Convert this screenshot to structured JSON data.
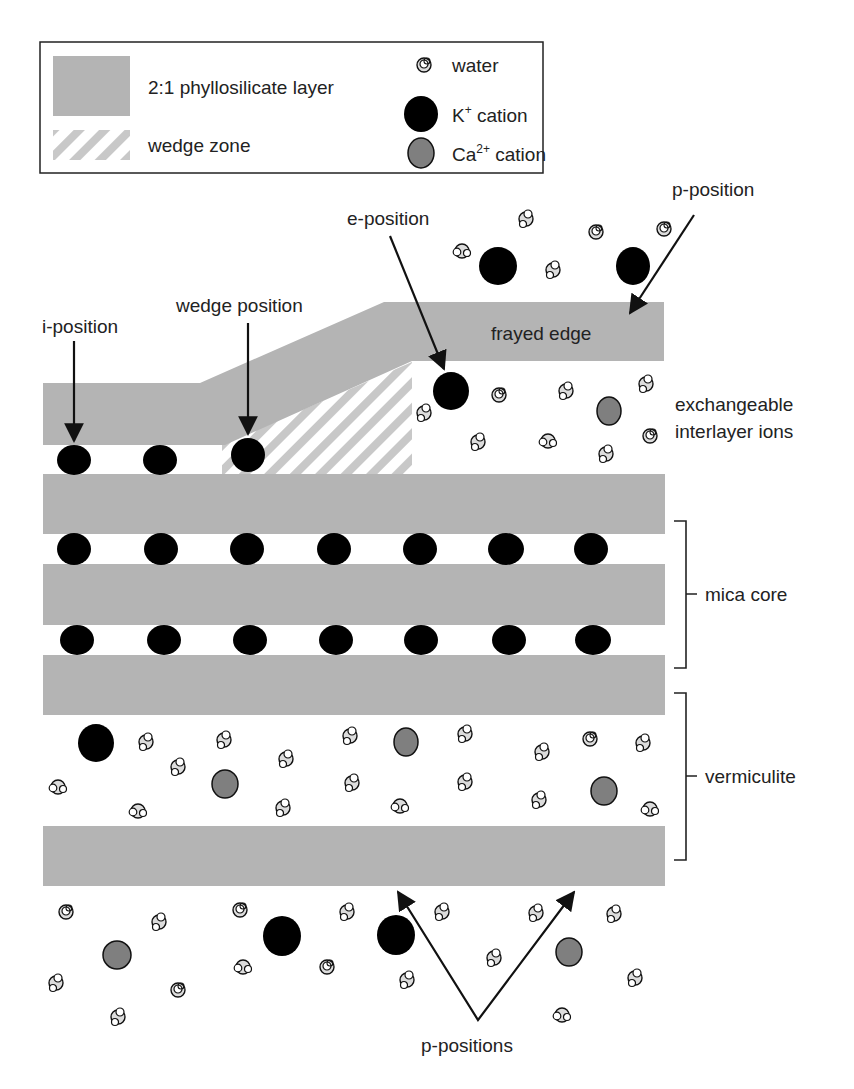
{
  "colors": {
    "layer": "#b4b4b4",
    "hatch": "#c8c8c8",
    "k_cation": "#000000",
    "ca_cation": "#7f7f7f",
    "water_o": "#dcdcdc",
    "outline": "#111111",
    "arrow": "#111111"
  },
  "legend": {
    "layer_label": "2:1 phyllosilicate layer",
    "wedge_label": "wedge zone",
    "water_label": "water",
    "k_label": "K",
    "k_sup": "+",
    "k_suffix": " cation",
    "ca_label": "Ca",
    "ca_sup": "2+",
    "ca_suffix": " cation"
  },
  "labels": {
    "i_position": "i-position",
    "wedge_position": "wedge position",
    "e_position": "e-position",
    "p_position": "p-position",
    "frayed_edge": "frayed edge",
    "exchangeable_1": "exchangeable",
    "exchangeable_2": "interlayer ions",
    "mica_core": "mica core",
    "vermiculite": "vermiculite",
    "p_positions": "p-positions"
  },
  "structure": {
    "layers": [
      {
        "name": "frayed-top-layer",
        "type": "bent"
      },
      {
        "name": "layer-2",
        "y": 474,
        "h": 60
      },
      {
        "name": "layer-3",
        "y": 564,
        "h": 61
      },
      {
        "name": "layer-4",
        "y": 655,
        "h": 60
      },
      {
        "name": "layer-5",
        "y": 826,
        "h": 60
      }
    ],
    "mica_interlayer_k_x": [
      74,
      161,
      247,
      334,
      420,
      506,
      591
    ]
  }
}
